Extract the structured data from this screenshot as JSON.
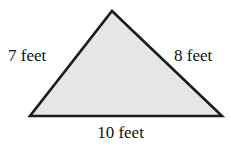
{
  "figure": {
    "name": "labeled-triangle-diagram",
    "shape": "triangle",
    "background_color": "#ffffff",
    "fill_color": "#e9e9e9",
    "stroke_color": "#1a1a1a",
    "text_color": "#101010",
    "unit": "feet",
    "vertices": {
      "apex": [
        112,
        11
      ],
      "bottom_left": [
        30,
        116
      ],
      "bottom_right": [
        222,
        116
      ]
    },
    "labels": {
      "left_side": "7 feet",
      "right_side": "8 feet",
      "bottom_side": "10 feet"
    },
    "side_lengths": {
      "left": 7,
      "right": 8,
      "bottom": 10
    }
  }
}
